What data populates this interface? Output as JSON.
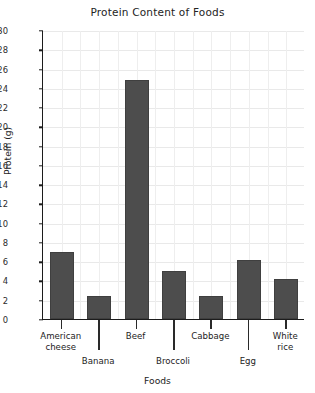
{
  "chart_data": {
    "type": "bar",
    "title": "Protein Content of Foods",
    "xlabel": "Foods",
    "ylabel": "Protein (g)",
    "categories": [
      "American cheese",
      "Banana",
      "Beef",
      "Broccoli",
      "Cabbage",
      "Egg",
      "White rice"
    ],
    "values": [
      7.0,
      2.4,
      24.8,
      5.0,
      2.4,
      6.1,
      4.2
    ],
    "ylim": [
      0,
      30
    ],
    "ytick_step": 2,
    "yticks": [
      0,
      2,
      4,
      6,
      8,
      10,
      12,
      14,
      16,
      18,
      20,
      22,
      24,
      26,
      28,
      30
    ],
    "ytick_labels": [
      "0",
      "2",
      "4",
      "6",
      "8",
      "10",
      "12",
      "14",
      "16",
      "18",
      "20",
      "22",
      "24",
      "26",
      "28",
      "30"
    ],
    "grid": true,
    "grid_horizontal": true,
    "grid_vertical": true,
    "vertical_grid_count": 14,
    "legend": null,
    "legend_position": "none",
    "bar_color": "#4d4d4d",
    "axis_color": "#1c1c1c",
    "grid_color": "#e9e9e9",
    "background_color": "#ffffff",
    "text_color": "#232323",
    "category_label_rows": [
      "top",
      "bottom",
      "top",
      "bottom",
      "top",
      "bottom",
      "top"
    ],
    "category_label_lines": [
      [
        "American",
        "cheese"
      ],
      [
        "Banana"
      ],
      [
        "Beef"
      ],
      [
        "Broccoli"
      ],
      [
        "Cabbage"
      ],
      [
        "Egg"
      ],
      [
        "White",
        "rice"
      ]
    ]
  }
}
